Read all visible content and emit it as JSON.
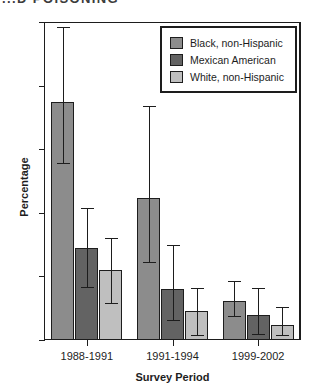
{
  "figure": {
    "clipped_title": "...D POISONING"
  },
  "chart_data": {
    "type": "bar",
    "title": "",
    "xlabel": "Survey Period",
    "ylabel": "Percentage",
    "ylim": [
      0,
      25
    ],
    "yticks": [
      0,
      5,
      10,
      15,
      20,
      25
    ],
    "grid": false,
    "legend_position": "top-right",
    "error_bars": "95% confidence interval",
    "categories": [
      "1988-1991",
      "1991-1994",
      "1999-2002"
    ],
    "series": [
      {
        "name": "Black, non-Hispanic",
        "color": "#8c8c8c",
        "values": [
          18.7,
          11.2,
          3.1
        ],
        "ci_low": [
          13.9,
          6.1,
          1.9
        ],
        "ci_high": [
          24.6,
          18.4,
          4.6
        ]
      },
      {
        "name": "Mexican American",
        "color": "#636363",
        "values": [
          7.2,
          4.0,
          2.0
        ],
        "ci_low": [
          4.2,
          1.6,
          0.5
        ],
        "ci_high": [
          10.4,
          7.5,
          4.1
        ]
      },
      {
        "name": "White, non-Hispanic",
        "color": "#bfbfbf",
        "values": [
          5.5,
          2.3,
          1.2
        ],
        "ci_low": [
          2.9,
          0.4,
          0.4
        ],
        "ci_high": [
          8.0,
          4.1,
          2.6
        ]
      }
    ]
  }
}
